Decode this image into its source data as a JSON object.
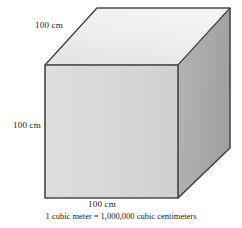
{
  "figure": {
    "type": "cube-diagram",
    "caption": "1 cubic meter = 1,000,000 cubic centimeters",
    "caption_parts": {
      "left": "1 cubic meter",
      "equals": "=",
      "right": "1,000,000 cubic centimeters"
    },
    "labels": {
      "top_edge": "100 cm",
      "left_edge": "100 cm",
      "bottom_edge": "100 cm"
    },
    "colors": {
      "top_face": "#e9ebe9",
      "front_face": "#d4d7d4",
      "right_face": "#a9aba9",
      "outline": "#4a4a4a",
      "text": "#1a1a1a",
      "background": "#ffffff"
    },
    "geometry": {
      "front_face_points": "45,65 178,65 178,198 45,198",
      "top_face_points": "45,65 97,8 230,8 178,65",
      "right_face_points": "178,65 230,8 230,148 178,198"
    }
  }
}
